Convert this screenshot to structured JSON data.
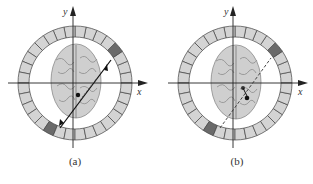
{
  "figure": {
    "panels": [
      {
        "id": "a",
        "caption": "(a)",
        "x_axis_label": "x",
        "y_axis_label": "y",
        "ring_segments": 32,
        "highlighted_segments": [
          "upper-right",
          "lower-left"
        ],
        "line_style": "solid-arrows",
        "description": "Detector ring around brain; solid double-ended line of response through annihilation point"
      },
      {
        "id": "b",
        "caption": "(b)",
        "x_axis_label": "x",
        "y_axis_label": "y",
        "ring_segments": 32,
        "highlighted_segments": [
          "upper-right",
          "lower-left"
        ],
        "line_style": "dashed",
        "description": "Detector ring around brain; dashed line of response offset from annihilation points"
      }
    ],
    "colors": {
      "segment_fill": "#d4d4d4",
      "segment_highlight": "#6a6a6a",
      "segment_stroke": "#444444",
      "axis": "#222222",
      "brain": "#c8c8c8"
    }
  }
}
